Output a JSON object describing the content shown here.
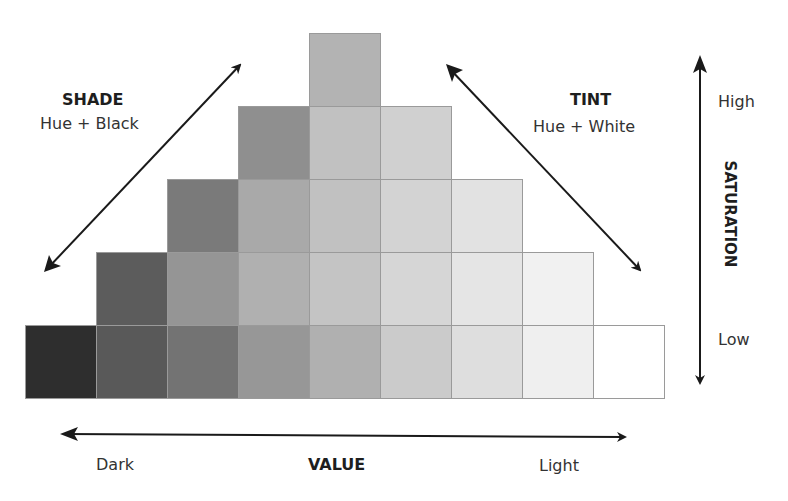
{
  "shade": {
    "title": "SHADE",
    "subtitle": "Hue + Black"
  },
  "tint": {
    "title": "TINT",
    "subtitle": "Hue + White"
  },
  "saturation": {
    "title": "SATURATION",
    "high": "High",
    "low": "Low"
  },
  "value": {
    "title": "VALUE",
    "dark": "Dark",
    "light": "Light"
  },
  "grid": {
    "origin_x": 25,
    "origin_y": 33,
    "cell_w": 71,
    "cell_h": 73,
    "rows": [
      {
        "start_col": 4,
        "colors": [
          "#b3b3b3"
        ]
      },
      {
        "start_col": 3,
        "colors": [
          "#8f8f8f",
          "#c1c1c1",
          "#d0d0d0"
        ]
      },
      {
        "start_col": 2,
        "colors": [
          "#7a7a7a",
          "#a9a9a9",
          "#c1c1c1",
          "#d3d3d3",
          "#e2e2e2"
        ]
      },
      {
        "start_col": 1,
        "colors": [
          "#5c5c5c",
          "#959595",
          "#b0b0b0",
          "#c4c4c4",
          "#d6d6d6",
          "#e5e5e5",
          "#f1f1f1"
        ]
      },
      {
        "start_col": 0,
        "colors": [
          "#2e2e2e",
          "#595959",
          "#737373",
          "#979797",
          "#b0b0b0",
          "#cbcbcb",
          "#dedede",
          "#efefef",
          "#ffffff"
        ]
      }
    ]
  },
  "colors": {
    "arrow": "#1a1a1a",
    "cell_border": "#9a9a9a"
  }
}
